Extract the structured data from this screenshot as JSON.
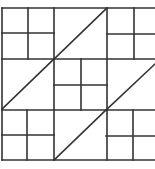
{
  "diagram": {
    "title": "",
    "type": "quilt-block-pattern",
    "stroke_color": "#333333",
    "background_color": "#ffffff",
    "stroke_width": 1.6,
    "outer_border": {
      "left": 2,
      "top": 8,
      "bottom": 160,
      "right_cropped": true
    },
    "grid": {
      "columns_x": [
        2,
        54,
        107
      ],
      "rows_y": [
        8,
        59,
        110,
        160
      ]
    },
    "four_patch_blocks": [
      {
        "name": "top-left",
        "x": 2,
        "y": 8,
        "w": 52,
        "h": 51,
        "mid_x": 28,
        "mid_y": 33
      },
      {
        "name": "top-right",
        "x": 107,
        "y": 8,
        "w": 48,
        "h": 51,
        "mid_x": 134,
        "mid_y": 34
      },
      {
        "name": "center",
        "x": 54,
        "y": 59,
        "w": 53,
        "h": 51,
        "mid_x": 81,
        "mid_y": 85
      },
      {
        "name": "bottom-left",
        "x": 2,
        "y": 110,
        "w": 52,
        "h": 50,
        "mid_x": 27,
        "mid_y": 135
      },
      {
        "name": "bottom-right",
        "x": 106,
        "y": 110,
        "w": 49,
        "h": 50,
        "mid_x": 133,
        "mid_y": 136
      }
    ],
    "diagonals": [
      {
        "name": "top-center-diagonal",
        "x1": 54,
        "y1": 59,
        "x2": 107,
        "y2": 8
      },
      {
        "name": "middle-left-diagonal",
        "x1": 2,
        "y1": 109,
        "x2": 54,
        "y2": 59
      },
      {
        "name": "bottom-center-diagonal",
        "x1": 54,
        "y1": 160,
        "x2": 106,
        "y2": 110
      },
      {
        "name": "middle-right-diagonal",
        "x1": 106,
        "y1": 110,
        "x2": 155,
        "y2": 64
      }
    ]
  }
}
